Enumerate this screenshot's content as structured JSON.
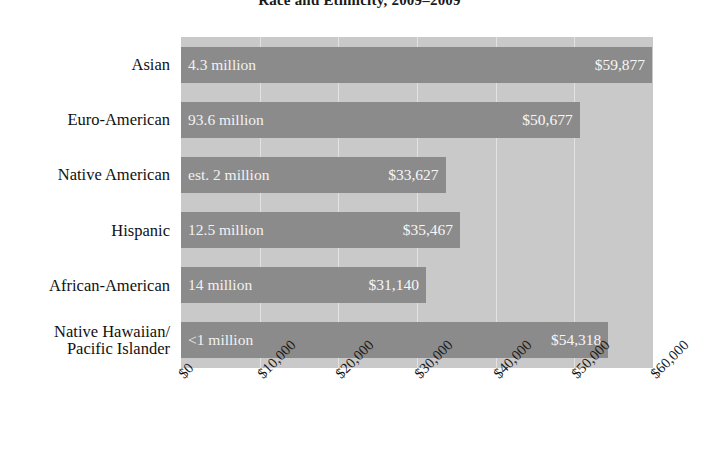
{
  "chart_data": {
    "type": "bar",
    "orientation": "horizontal",
    "title": "Race and Ethnicity, 2009–2009",
    "xlabel": "",
    "ylabel": "",
    "xlim": [
      0,
      60000
    ],
    "grid": true,
    "legend": null,
    "categories": [
      "Asian",
      "Euro-American",
      "Native American",
      "Hispanic",
      "African-American",
      "Native Hawaiian/\nPacific Islander"
    ],
    "values": [
      59877,
      50677,
      33627,
      35467,
      31140,
      54318
    ],
    "value_labels": [
      "$59,877",
      "$50,677",
      "$33,627",
      "$35,467",
      "$31,140",
      "$54,318"
    ],
    "population_labels": [
      "4.3 million",
      "93.6 million",
      "est. 2 million",
      "12.5 million",
      "14 million",
      "<1 million"
    ],
    "xticks": [
      0,
      10000,
      20000,
      30000,
      40000,
      50000,
      60000
    ],
    "xticklabels": [
      "$0",
      "$10,000",
      "$20,000",
      "$30,000",
      "$40,000",
      "$50,000",
      "$60,000"
    ],
    "colors": {
      "bar": "#8b8b8b",
      "plot_background": "#c9c9c9",
      "gridline": "#e2e2e2",
      "bar_text": "#f5f5f5",
      "axis_text": "#111111",
      "page_background": "#ffffff"
    }
  }
}
